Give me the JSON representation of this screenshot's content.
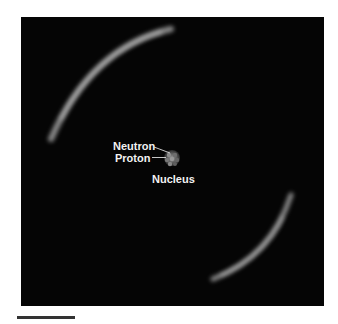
{
  "diagram": {
    "labels": {
      "neutron": "Neutron",
      "proton": "Proton",
      "nucleus": "Nucleus"
    },
    "colors": {
      "background": "#050505",
      "electron_cloud": "#bdbdbd",
      "label_text": "#f2f2f2"
    }
  }
}
